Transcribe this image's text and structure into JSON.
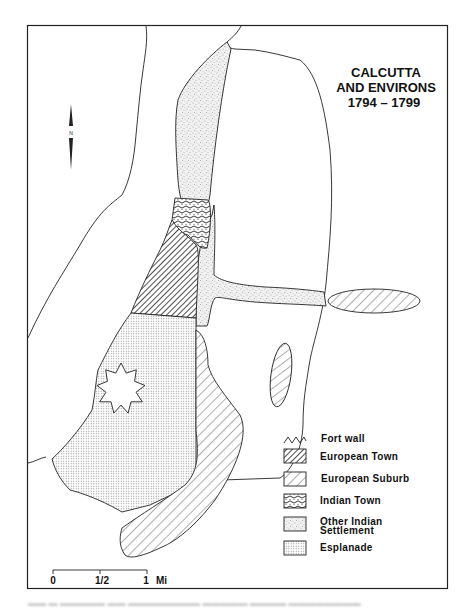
{
  "map": {
    "title_lines": [
      "CALCUTTA",
      "AND ENVIRONS",
      "1794 – 1799"
    ],
    "north_arrow": {
      "label": "N",
      "icon": "north-arrow-icon"
    },
    "legend": {
      "items": [
        {
          "key": "fort_wall",
          "label": "Fort wall",
          "pattern": "zigzag"
        },
        {
          "key": "european_town",
          "label": "European Town",
          "pattern": "dense-hatch"
        },
        {
          "key": "european_suburb",
          "label": "European Suburb",
          "pattern": "sparse-hatch"
        },
        {
          "key": "indian_town",
          "label": "Indian Town",
          "pattern": "wavy-dots"
        },
        {
          "key": "other_indian_settlement",
          "label_lines": [
            "Other Indian",
            "Settlement"
          ],
          "pattern": "fine-stipple"
        },
        {
          "key": "esplanade",
          "label": "Esplanade",
          "pattern": "dot-grid"
        }
      ]
    },
    "scale_bar": {
      "ticks": [
        "0",
        "1/2",
        "1"
      ],
      "unit": "Mi"
    },
    "colors": {
      "ink": "#1a1a1a",
      "paper": "#ffffff",
      "stipple": "#e6e6e6",
      "frame": "#222222"
    }
  }
}
